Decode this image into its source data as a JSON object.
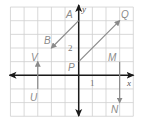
{
  "diagram": {
    "type": "coordinate-plane-vectors",
    "grid": {
      "x_min": -5,
      "x_max": 4,
      "y_min": -3,
      "y_max": 5,
      "grid_color": "#cfcfcf",
      "axis_color": "#1a1a1a"
    },
    "axes": {
      "x_label": "x",
      "y_label": "y",
      "x_tick_label": "1",
      "y_tick_label": "2"
    },
    "vectors": [
      {
        "name": "AB",
        "tail_label": "A",
        "head_label": "B",
        "tail": [
          0,
          4
        ],
        "head": [
          -2,
          2
        ]
      },
      {
        "name": "PQ",
        "tail_label": "P",
        "head_label": "Q",
        "tail": [
          0,
          1
        ],
        "head": [
          3,
          4
        ]
      },
      {
        "name": "MN",
        "tail_label": "M",
        "head_label": "N",
        "tail": [
          3,
          1
        ],
        "head": [
          3,
          -2
        ]
      },
      {
        "name": "UV",
        "tail_label": "U",
        "head_label": "V",
        "tail": [
          -3,
          -1
        ],
        "head": [
          -3,
          1
        ]
      }
    ],
    "vector_color": "#8a8a8a",
    "label_color": "#8a8a8a"
  }
}
